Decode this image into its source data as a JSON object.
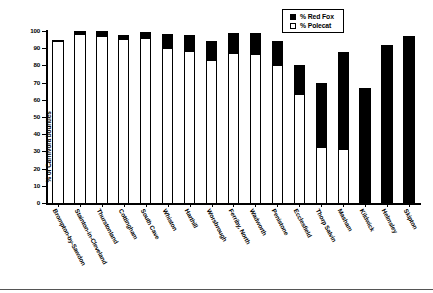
{
  "chart_data": {
    "type": "bar",
    "subtype": "stacked-column",
    "title": "",
    "xlabel": "",
    "ylabel": "% of Carnivora bounties",
    "ylim": [
      0,
      100
    ],
    "yticks": [
      0,
      10,
      20,
      30,
      40,
      50,
      60,
      70,
      80,
      90,
      100
    ],
    "grid": false,
    "legend_position": "top-right",
    "categories": [
      "Brompton-by-Sawdon",
      "Stainton-in-Cleveland",
      "Thurstonland",
      "Cottingham",
      "South Cave",
      "Whiston",
      "Harthill",
      "Worsbrough",
      "Ferriby, North",
      "Wadworth",
      "Penistone",
      "Ecclesfield",
      "Thorp Salvin",
      "Masham",
      "Kildwick",
      "Helmsley",
      "Skipton"
    ],
    "series": [
      {
        "name": "% Polecat",
        "color": "#ffffff",
        "values": [
          94,
          98,
          97,
          95.5,
          96,
          90,
          88.5,
          83,
          87,
          86.5,
          80.5,
          63.5,
          32.5,
          31.5,
          0,
          0,
          0
        ]
      },
      {
        "name": "% Red Fox",
        "color": "#000000",
        "values": [
          1,
          2,
          3,
          2,
          3.5,
          8,
          9,
          11,
          12,
          12.5,
          13.5,
          16.5,
          37.5,
          56.5,
          67,
          92,
          97
        ]
      }
    ],
    "totals": [
      95,
      100,
      100,
      97.5,
      99.5,
      98,
      97.5,
      94,
      99,
      99,
      94,
      80,
      70,
      88,
      67,
      92,
      97
    ]
  },
  "legend": {
    "items": [
      {
        "label": "% Red Fox",
        "swatch": "filled-black"
      },
      {
        "label": "%  Polecat",
        "swatch": "outline-white"
      }
    ]
  },
  "axes": {
    "y_title": "% of Carnivora bounties",
    "y_tick_labels": [
      "100",
      "90",
      "80",
      "70",
      "60",
      "50",
      "40",
      "30",
      "20",
      "10",
      "0"
    ]
  }
}
